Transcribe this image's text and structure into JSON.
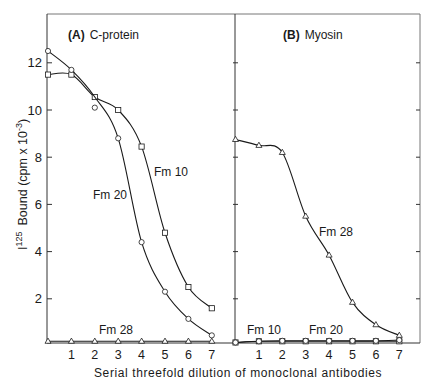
{
  "chart_data": [
    {
      "type": "line",
      "panel": "A",
      "title_bold": "(A)",
      "title": "C-protein",
      "xlabel": "Serial threefold dilution of monoclonal antibodies",
      "ylabel_prefix": "I",
      "ylabel_superscript": "125",
      "ylabel": "Bound (cpm x 10^-3)",
      "x": [
        0,
        1,
        2,
        3,
        4,
        5,
        6,
        7
      ],
      "x_tick_labels": [
        "1",
        "2",
        "3",
        "4",
        "5",
        "6",
        "7"
      ],
      "y_tick_labels": [
        "2",
        "4",
        "6",
        "8",
        "10",
        "12"
      ],
      "ylim": [
        0,
        13.5
      ],
      "grid": false,
      "series": [
        {
          "name": "Fm 10",
          "marker": "square",
          "values": [
            11.5,
            11.5,
            10.55,
            10.0,
            8.45,
            4.8,
            2.5,
            1.6
          ]
        },
        {
          "name": "Fm 20",
          "marker": "circle",
          "values": [
            12.5,
            11.7,
            10.1,
            8.8,
            4.4,
            2.3,
            1.15,
            0.45
          ]
        },
        {
          "name": "Fm 28",
          "marker": "triangle",
          "values": [
            0.2,
            0.2,
            0.2,
            0.2,
            0.2,
            0.2,
            0.2,
            0.2
          ]
        }
      ],
      "annotations": [
        "Fm 10",
        "Fm 20",
        "Fm 28"
      ]
    },
    {
      "type": "line",
      "panel": "B",
      "title_bold": "(B)",
      "title": "Myosin",
      "x": [
        0,
        1,
        2,
        3,
        4,
        5,
        6,
        7
      ],
      "x_tick_labels": [
        "1",
        "2",
        "3",
        "4",
        "5",
        "6",
        "7"
      ],
      "ylim": [
        0,
        13.5
      ],
      "grid": false,
      "series": [
        {
          "name": "Fm 28",
          "marker": "triangle",
          "values": [
            8.75,
            8.5,
            8.2,
            5.5,
            3.85,
            1.85,
            0.9,
            0.45
          ]
        },
        {
          "name": "Fm 10",
          "marker": "square",
          "values": [
            0.15,
            0.2,
            0.2,
            0.2,
            0.2,
            0.2,
            0.2,
            0.2
          ]
        },
        {
          "name": "Fm 20",
          "marker": "circle",
          "values": [
            0.15,
            0.2,
            0.22,
            0.22,
            0.22,
            0.22,
            0.22,
            0.25
          ]
        }
      ],
      "annotations": [
        "Fm 28",
        "Fm 10",
        "Fm 20"
      ]
    }
  ],
  "labels": {
    "panelA_bold": "(A)",
    "panelA_title": "C-protein",
    "panelB_bold": "(B)",
    "panelB_title": "Myosin",
    "xlabel": "Serial threefold dilution of monoclonal antibodies",
    "ylabel_prefix": "I",
    "ylabel_sup": "125",
    "ylabel_main": "Bound (cpm  x  10",
    "ylabel_exp": "-3",
    "ylabel_close": ")",
    "A_fm10": "Fm 10",
    "A_fm20": "Fm 20",
    "A_fm28": "Fm 28",
    "B_fm28": "Fm 28",
    "B_fm10": "Fm 10",
    "B_fm20": "Fm 20"
  }
}
